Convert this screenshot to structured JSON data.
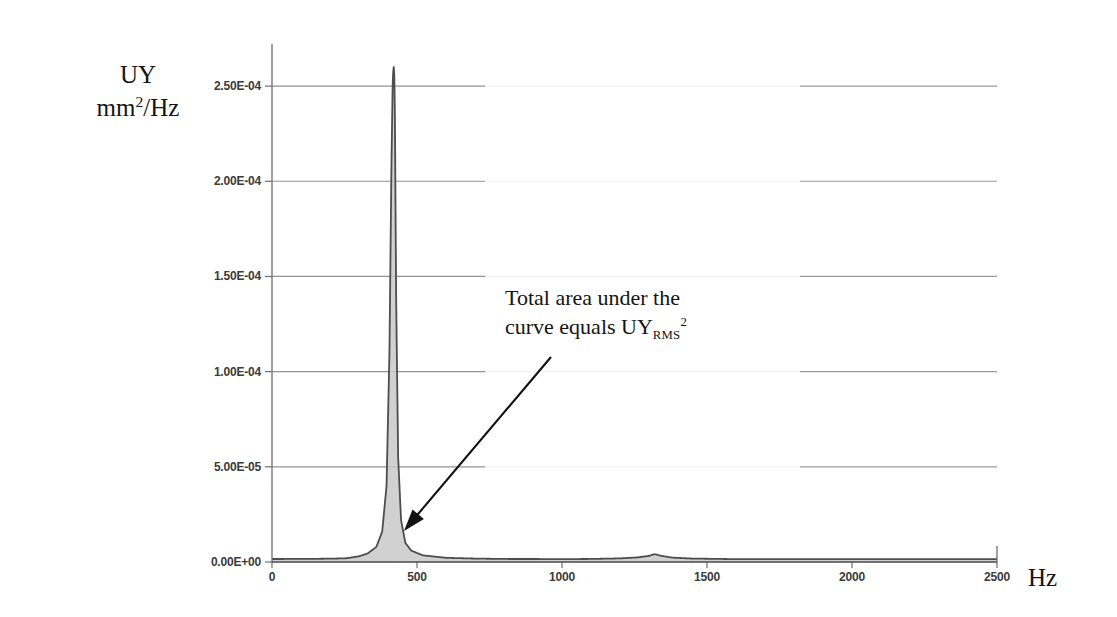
{
  "figure": {
    "background_color": "#ffffff",
    "axis_color": "#6e6e6e",
    "grid_color": "#808080",
    "curve_color": "#4d4d4d",
    "fill_color": "#c9c9c9",
    "annotation_color": "#141414"
  },
  "axes": {
    "y_title_line1": "UY",
    "y_title_line2_base": "mm",
    "y_title_line2_sup": "2",
    "y_title_line2_tail": "/Hz",
    "x_title": "Hz"
  },
  "annotation": {
    "line1": "Total area under the",
    "line2_pre": "curve equals UY",
    "line2_sub": "RMS",
    "line2_sup": "2",
    "arrow": {
      "from_x": 551,
      "from_y": 357,
      "to_x": 404,
      "to_y": 531
    }
  },
  "chart_data": {
    "type": "line",
    "title": "",
    "xlabel": "Hz",
    "ylabel": "UY mm2/Hz",
    "xlim": [
      0,
      2500
    ],
    "ylim": [
      0,
      0.00027
    ],
    "grid": true,
    "legend": "none",
    "fill_under_curve": true,
    "x_ticks": [
      0,
      500,
      1000,
      1500,
      2000,
      2500
    ],
    "x_tick_labels": [
      "0",
      "500",
      "1000",
      "1500",
      "2000",
      "2500"
    ],
    "y_ticks": [
      0.0,
      5e-05,
      0.0001,
      0.00015,
      0.0002,
      0.00025
    ],
    "y_tick_labels": [
      "0.00E+00",
      "5.00E-05",
      "1.00E-04",
      "1.50E-04",
      "2.00E-04",
      "2.50E-04"
    ],
    "peaks": [
      {
        "frequency_hz": 420,
        "amplitude": 0.00026,
        "half_width_hz": 7,
        "label": "primary-resonance"
      },
      {
        "frequency_hz": 1320,
        "amplitude": 4e-06,
        "half_width_hz": 28,
        "label": "secondary-resonance"
      }
    ],
    "baseline": 1.5e-06,
    "series": [
      {
        "name": "UY PSD",
        "x": [
          0,
          100,
          200,
          250,
          300,
          330,
          360,
          380,
          395,
          405,
          412,
          416,
          418,
          420,
          422,
          424,
          428,
          435,
          445,
          460,
          480,
          520,
          600,
          700,
          800,
          900,
          1000,
          1100,
          1200,
          1260,
          1300,
          1320,
          1340,
          1380,
          1450,
          1600,
          1800,
          2000,
          2200,
          2400,
          2500
        ],
        "y": [
          1e-06,
          1.1e-06,
          1.4e-06,
          1.8e-06,
          3e-06,
          4.5e-06,
          8e-06,
          1.6e-05,
          4e-05,
          0.00011,
          0.00021,
          0.00025,
          0.000258,
          0.00026,
          0.000255,
          0.00023,
          0.00014,
          5.5e-05,
          2.2e-05,
          1e-05,
          6e-06,
          3.5e-06,
          2.2e-06,
          1.8e-06,
          1.6e-06,
          1.5e-06,
          1.5e-06,
          1.6e-06,
          1.9e-06,
          2.4e-06,
          3.2e-06,
          4e-06,
          3.3e-06,
          2.3e-06,
          1.8e-06,
          1.5e-06,
          1.4e-06,
          1.3e-06,
          1.3e-06,
          1.2e-06,
          1.2e-06
        ]
      }
    ]
  }
}
